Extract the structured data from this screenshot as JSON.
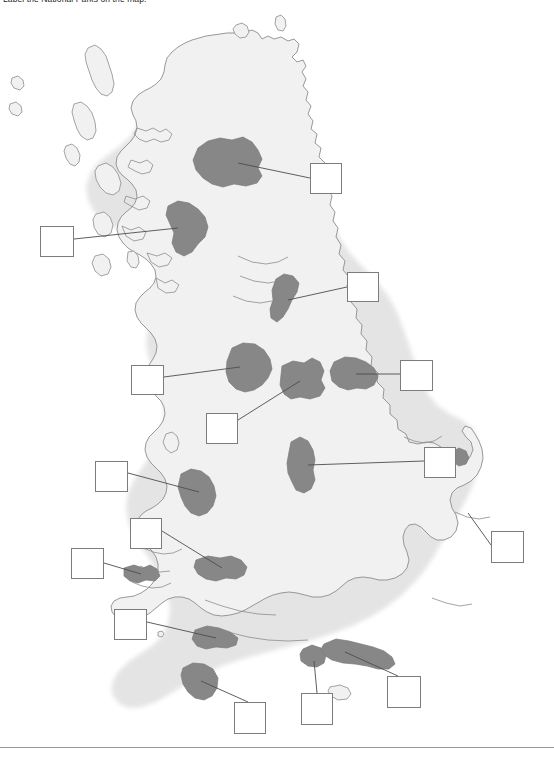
{
  "worksheet": {
    "instruction": "Label the National Parks on the map.",
    "footer_rule": true
  },
  "map": {
    "name": "great-britain-outline",
    "land_fill": "#f1f1f1",
    "land_stroke": "#8d8d8d",
    "halo": "#e6e6e6",
    "park_fill": "#878787",
    "park_stroke": "#7a7a7a",
    "leader_stroke": "#4d4d4d",
    "box_border": "#7c7c7c",
    "box_fill": "#ffffff",
    "background": "#ffffff"
  },
  "answer_boxes": [
    {
      "id": "box-1",
      "label": "",
      "x": 310,
      "y": 163,
      "w": 32,
      "h": 31
    },
    {
      "id": "box-2",
      "label": "",
      "x": 40,
      "y": 226,
      "w": 34,
      "h": 31
    },
    {
      "id": "box-3",
      "label": "",
      "x": 347,
      "y": 272,
      "w": 32,
      "h": 30
    },
    {
      "id": "box-4",
      "label": "",
      "x": 131,
      "y": 365,
      "w": 33,
      "h": 30
    },
    {
      "id": "box-5",
      "label": "",
      "x": 400,
      "y": 360,
      "w": 33,
      "h": 31
    },
    {
      "id": "box-6",
      "label": "",
      "x": 206,
      "y": 413,
      "w": 32,
      "h": 31
    },
    {
      "id": "box-7",
      "label": "",
      "x": 424,
      "y": 447,
      "w": 32,
      "h": 31
    },
    {
      "id": "box-8",
      "label": "",
      "x": 95,
      "y": 461,
      "w": 33,
      "h": 31
    },
    {
      "id": "box-9",
      "label": "",
      "x": 130,
      "y": 518,
      "w": 32,
      "h": 31
    },
    {
      "id": "box-10",
      "label": "",
      "x": 491,
      "y": 531,
      "w": 33,
      "h": 32
    },
    {
      "id": "box-11",
      "label": "",
      "x": 71,
      "y": 548,
      "w": 33,
      "h": 31
    },
    {
      "id": "box-12",
      "label": "",
      "x": 114,
      "y": 609,
      "w": 33,
      "h": 31
    },
    {
      "id": "box-13",
      "label": "",
      "x": 301,
      "y": 693,
      "w": 32,
      "h": 32
    },
    {
      "id": "box-14",
      "label": "",
      "x": 234,
      "y": 702,
      "w": 32,
      "h": 32
    },
    {
      "id": "box-15",
      "label": "",
      "x": 387,
      "y": 676,
      "w": 34,
      "h": 32
    }
  ]
}
